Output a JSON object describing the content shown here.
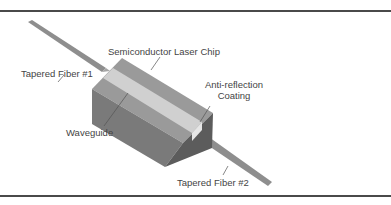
{
  "figure": {
    "labels": {
      "chip": "Semiconductor Laser Chip",
      "fiber1": "Tapered Fiber #1",
      "fiber2": "Tapered Fiber #2",
      "coating_line1": "Anti-reflection",
      "coating_line2": "Coating",
      "waveguide": "Waveguide"
    },
    "colors": {
      "chip_top": "#9a9a9a",
      "chip_left": "#7d7d7d",
      "chip_front": "#5f5f5f",
      "waveguide": "#d2d2d2",
      "coating": "#e6e6e6",
      "fiber": "#8e8e8e",
      "rule": "#4a4a4a",
      "text": "#444444"
    }
  }
}
